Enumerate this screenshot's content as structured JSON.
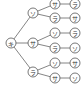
{
  "diagram": {
    "type": "tree",
    "root": {
      "label": "キ",
      "x": 11,
      "y": 43
    },
    "level1": [
      {
        "label": "ソ",
        "x": 33,
        "y": 13
      },
      {
        "label": "サ",
        "x": 33,
        "y": 43
      },
      {
        "label": "ラ",
        "x": 33,
        "y": 72
      }
    ],
    "level2": [
      {
        "label": "サ",
        "x": 55,
        "y": 4,
        "parent": 0
      },
      {
        "label": "ラ",
        "x": 55,
        "y": 18,
        "parent": 0
      },
      {
        "label": "ソ",
        "x": 55,
        "y": 33,
        "parent": 1
      },
      {
        "label": "ラ",
        "x": 55,
        "y": 48,
        "parent": 1
      },
      {
        "label": "ソ",
        "x": 55,
        "y": 63,
        "parent": 2
      },
      {
        "label": "サ",
        "x": 55,
        "y": 78,
        "parent": 2
      }
    ],
    "level3": [
      {
        "label": "ラ",
        "x": 75,
        "y": 4
      },
      {
        "label": "サ",
        "x": 75,
        "y": 18
      },
      {
        "label": "ラ",
        "x": 75,
        "y": 33
      },
      {
        "label": "ソ",
        "x": 75,
        "y": 48
      },
      {
        "label": "サ",
        "x": 75,
        "y": 63
      },
      {
        "label": "ソ",
        "x": 75,
        "y": 78
      }
    ]
  }
}
